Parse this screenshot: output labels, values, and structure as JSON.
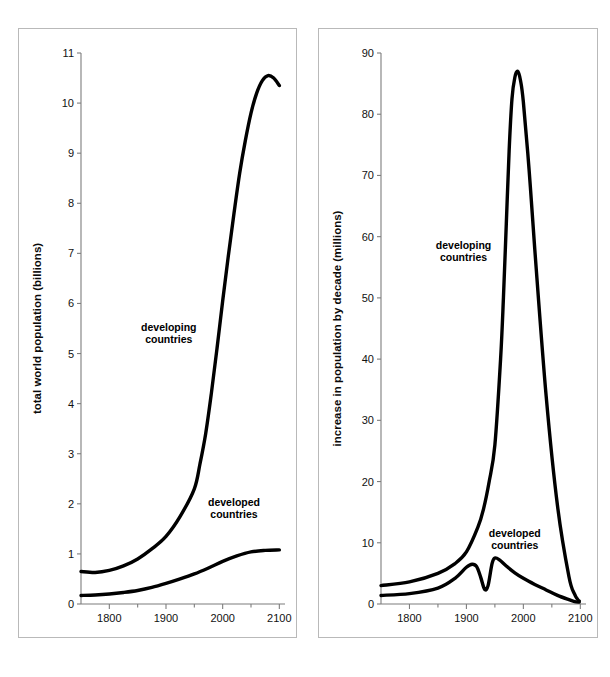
{
  "figure": {
    "background_color": "#ffffff",
    "panel_border_color": "#b9b9b9",
    "curve_color": "#000000",
    "axis_color": "#7d7d7d"
  },
  "chart_data": [
    {
      "id": "total-world-population",
      "type": "line",
      "title": "",
      "xlabel": "years",
      "ylabel": "total world population (billions)",
      "xlim": [
        1750,
        2110
      ],
      "ylim": [
        0,
        11
      ],
      "grid": false,
      "legend_position": "inline-annotation",
      "xticks": [
        1800,
        1900,
        2000,
        2100
      ],
      "xtick_labels": [
        "1800",
        "1900",
        "2000",
        "2100"
      ],
      "xminor_ticks": [
        1850,
        1950,
        2050
      ],
      "yticks": [
        0,
        1,
        2,
        3,
        4,
        5,
        6,
        7,
        8,
        9,
        10,
        11
      ],
      "ytick_labels": [
        "0",
        "1",
        "2",
        "3",
        "4",
        "5",
        "6",
        "7",
        "8",
        "9",
        "10",
        "11"
      ],
      "annotations": [
        {
          "text_line1": "developing",
          "text_line2": "countries",
          "x": 1905,
          "y": 5.45
        },
        {
          "text_line1": "developed",
          "text_line2": "countries",
          "x": 2020,
          "y": 1.95
        }
      ],
      "series": [
        {
          "name": "developing countries",
          "x": [
            1750,
            1775,
            1800,
            1825,
            1850,
            1875,
            1900,
            1925,
            1950,
            1960,
            1970,
            1980,
            1990,
            2000,
            2010,
            2020,
            2030,
            2040,
            2050,
            2060,
            2070,
            2080,
            2090,
            2100
          ],
          "values": [
            0.65,
            0.63,
            0.67,
            0.76,
            0.9,
            1.1,
            1.35,
            1.75,
            2.3,
            2.8,
            3.4,
            4.2,
            5.1,
            6.05,
            6.95,
            7.8,
            8.6,
            9.25,
            9.8,
            10.2,
            10.45,
            10.55,
            10.5,
            10.35
          ]
        },
        {
          "name": "developed countries",
          "x": [
            1750,
            1775,
            1800,
            1825,
            1850,
            1875,
            1900,
            1925,
            1950,
            1975,
            2000,
            2025,
            2050,
            2075,
            2100
          ],
          "values": [
            0.17,
            0.18,
            0.2,
            0.23,
            0.27,
            0.33,
            0.41,
            0.5,
            0.6,
            0.72,
            0.85,
            0.96,
            1.04,
            1.07,
            1.08
          ]
        }
      ]
    },
    {
      "id": "increase-in-population-by-decade",
      "type": "line",
      "title": "",
      "xlabel": "years",
      "ylabel": "increase in population by decade (millions)",
      "xlim": [
        1750,
        2110
      ],
      "ylim": [
        0,
        90
      ],
      "grid": false,
      "legend_position": "inline-annotation",
      "xticks": [
        1800,
        1900,
        2000,
        2100
      ],
      "xtick_labels": [
        "1800",
        "1900",
        "2000",
        "2100"
      ],
      "xminor_ticks": [
        1850,
        1950,
        2050
      ],
      "yticks": [
        0,
        10,
        20,
        30,
        40,
        50,
        60,
        70,
        80,
        90
      ],
      "ytick_labels": [
        "0",
        "10",
        "20",
        "30",
        "40",
        "50",
        "60",
        "70",
        "80",
        "90"
      ],
      "annotations": [
        {
          "text_line1": "developing",
          "text_line2": "countries",
          "x": 1895,
          "y": 58
        },
        {
          "text_line1": "developed",
          "text_line2": "countries",
          "x": 1985,
          "y": 11
        }
      ],
      "series": [
        {
          "name": "developing countries",
          "x": [
            1750,
            1800,
            1850,
            1880,
            1900,
            1920,
            1930,
            1940,
            1950,
            1960,
            1965,
            1970,
            1975,
            1980,
            1985,
            1990,
            1995,
            2000,
            2010,
            2020,
            2040,
            2060,
            2080,
            2090,
            2095,
            2098
          ],
          "values": [
            3.0,
            3.6,
            5.0,
            6.6,
            8.5,
            12.5,
            15.5,
            20.0,
            26.0,
            40.0,
            50.0,
            62.0,
            74.0,
            82.5,
            86.0,
            87.0,
            85.5,
            82.0,
            71.0,
            58.0,
            34.0,
            16.0,
            4.5,
            1.6,
            0.8,
            0.5
          ]
        },
        {
          "name": "developed countries",
          "x": [
            1750,
            1800,
            1850,
            1880,
            1900,
            1910,
            1918,
            1925,
            1932,
            1938,
            1945,
            1950,
            1958,
            1970,
            1985,
            2000,
            2020,
            2040,
            2060,
            2080,
            2090,
            2098
          ],
          "values": [
            1.4,
            1.7,
            2.6,
            4.2,
            6.0,
            6.5,
            6.1,
            4.4,
            2.4,
            3.0,
            6.6,
            7.5,
            7.2,
            6.2,
            5.1,
            4.2,
            3.2,
            2.3,
            1.4,
            0.7,
            0.4,
            0.3
          ]
        }
      ]
    }
  ]
}
